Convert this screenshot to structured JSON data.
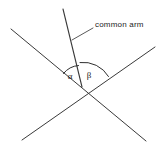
{
  "figure": {
    "background_color": "#ffffff",
    "line_color": "#3a3a3a",
    "text_color": "#1c1c1c",
    "width": 162,
    "height": 150
  },
  "labels": {
    "callout": "common arm",
    "alpha": "α",
    "beta": "β"
  },
  "geometry": {
    "vertex": {
      "x": 82,
      "y": 87
    },
    "common_arm": {
      "x1": 82,
      "y1": 87,
      "x2": 63,
      "y2": 9
    },
    "line_one": {
      "x1": 11,
      "y1": 29,
      "x2": 146,
      "y2": 141
    },
    "line_two": {
      "x1": 155,
      "y1": 47,
      "x2": 22,
      "y2": 140
    },
    "leader": {
      "x1": 72,
      "y1": 40,
      "x2": 93,
      "y2": 28
    },
    "alpha_arc": {
      "start_x": 64,
      "start_y": 74,
      "end_x": 78,
      "end_y": 66,
      "radius": 21
    },
    "beta_arc": {
      "start_x": 80,
      "start_y": 63,
      "end_x": 108,
      "end_y": 76,
      "radius": 29
    },
    "alpha_label_pos": {
      "x": 70,
      "y": 79
    },
    "beta_label_pos": {
      "x": 88,
      "y": 78
    },
    "callout_pos": {
      "x": 95,
      "y": 27
    }
  }
}
